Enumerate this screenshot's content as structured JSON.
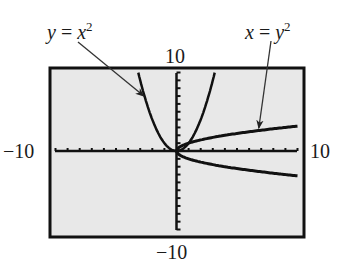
{
  "chart_data": {
    "type": "line",
    "title": "",
    "xlabel": "",
    "ylabel": "",
    "xlim": [
      -10,
      10
    ],
    "ylim": [
      -10,
      10
    ],
    "grid": false,
    "tick_step": 1,
    "window_labels": {
      "xmin": "−10",
      "xmax": "10",
      "ymin": "−10",
      "ymax": "10"
    },
    "series": [
      {
        "name": "y = x^2",
        "label_var": "y",
        "label_rhs": "x",
        "label_exp": "2",
        "equation": "y = x^2",
        "x_range": [
          -3.16,
          3.16
        ]
      },
      {
        "name": "x = y^2",
        "label_var": "x",
        "label_rhs": "y",
        "label_exp": "2",
        "equation": "x = y^2",
        "x_range": [
          0,
          10
        ]
      }
    ],
    "annotations": [
      {
        "text": "y = x²",
        "points_to": [
          -2.7,
          7.0
        ]
      },
      {
        "text": "x = y²",
        "points_to": [
          6.8,
          2.9
        ]
      }
    ]
  },
  "colors": {
    "plot_bg": "#e8e8e8",
    "frame": "#111111",
    "curve": "#111111",
    "arrow": "#333333",
    "text": "#1a1a1a"
  },
  "labels": {
    "eq1_var": "y",
    "eq1_eq": " = ",
    "eq1_rhs": "x",
    "eq1_exp": "2",
    "eq2_var": "x",
    "eq2_eq": " = ",
    "eq2_rhs": "y",
    "eq2_exp": "2",
    "ymax": "10",
    "ymin": "−10",
    "xmin": "−10",
    "xmax": "10"
  }
}
